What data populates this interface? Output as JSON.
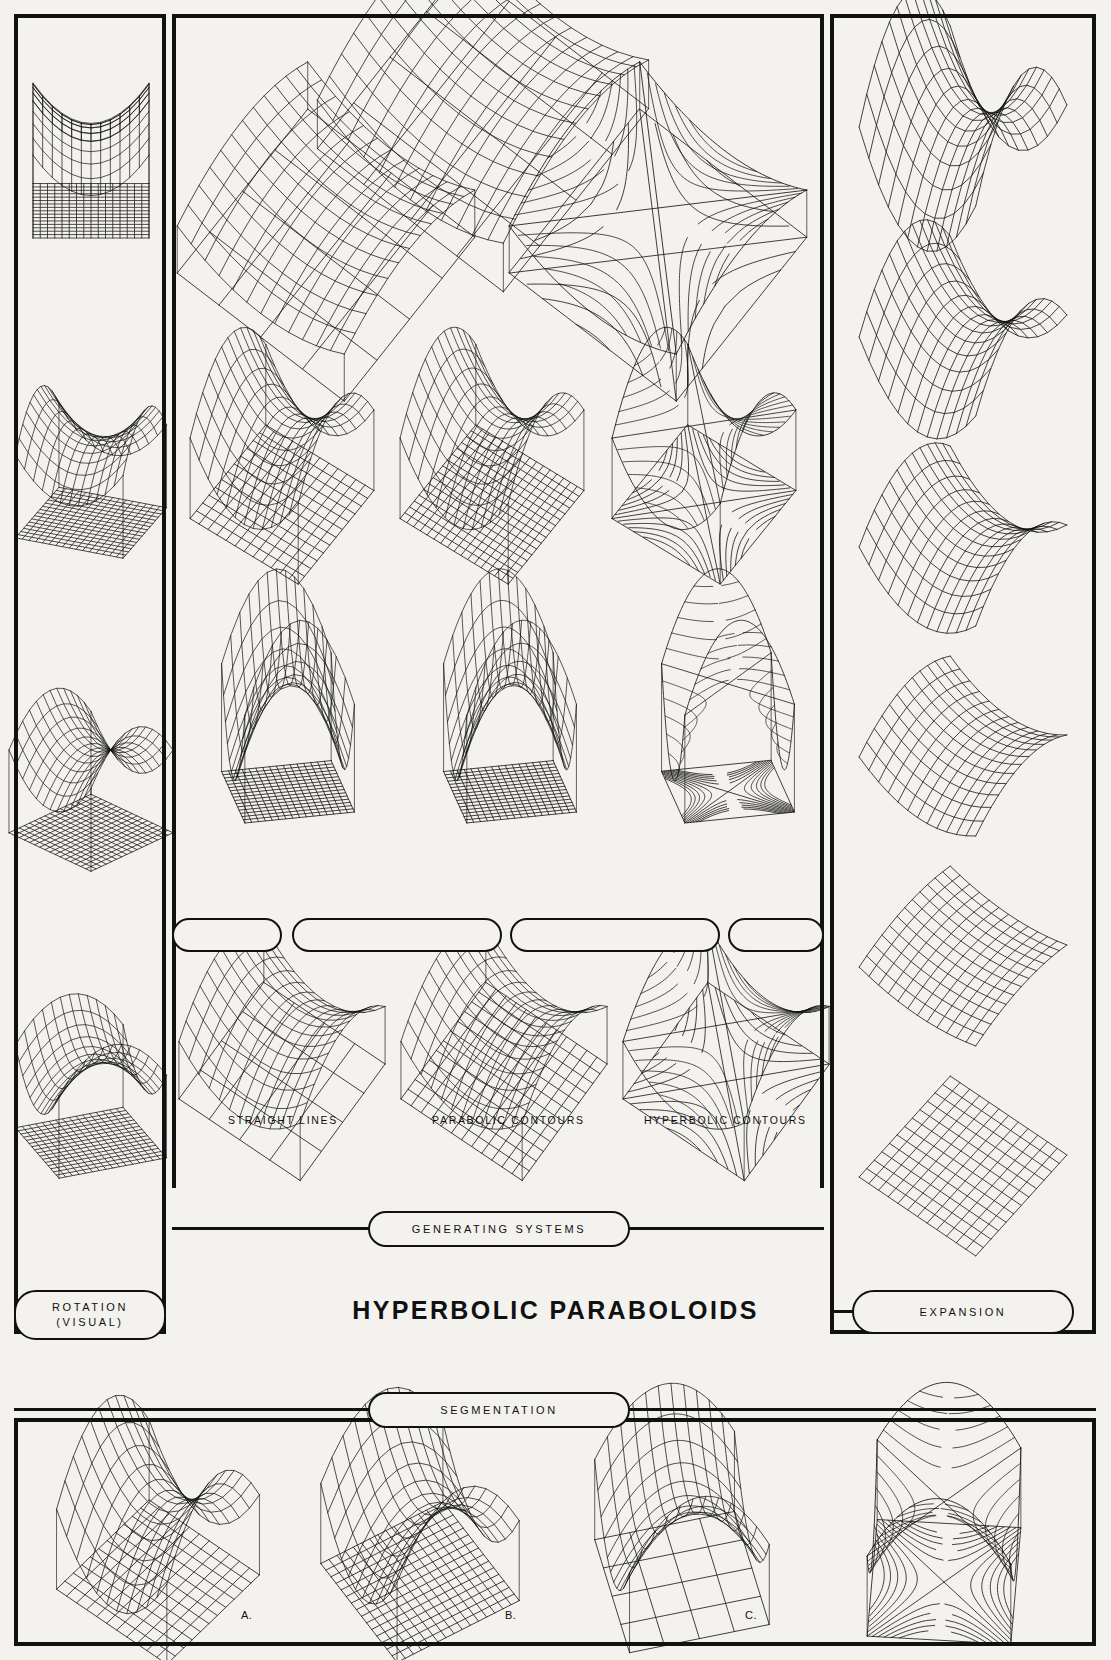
{
  "plate": {
    "title": "HYPERBOLIC PARABOLOIDS",
    "background": "#f4f2ee",
    "ink": "#111111"
  },
  "panels": {
    "rotation": {
      "label": "ROTATION",
      "sublabel": "(VISUAL)"
    },
    "expansion": {
      "label": "EXPANSION"
    },
    "generating": {
      "label": "GENERATING SYSTEMS"
    },
    "segmentation": {
      "label": "SEGMENTATION"
    }
  },
  "generating_captions": [
    "STRAIGHT LINES",
    "PARABOLIC CONTOURS",
    "HYPERBOLIC CONTOURS"
  ],
  "segmentation_letters": [
    "A.",
    "B.",
    "C.",
    "D."
  ],
  "chart_data": {
    "type": "surface-wireframe-plate",
    "title": "HYPERBOLIC PARABOLOIDS",
    "surface_equation": "z = a*x^2 - b*y^2",
    "domain": [
      -1,
      1
    ],
    "grid_divisions": 12,
    "projection": {
      "kind": "oblique-axonometric",
      "azimuth_deg": 35,
      "elevation_deg": 24
    },
    "columns": {
      "rotation": {
        "description": "Visual rotation of one saddle about the vertical axis, with projected base grid",
        "cells": [
          {
            "id": "rot-1",
            "yaw_deg": 0,
            "a": 1.0,
            "b": 1.0,
            "base": "grid",
            "base_style": "mesh",
            "drop_lines": true
          },
          {
            "id": "rot-2",
            "yaw_deg": 22,
            "a": 1.0,
            "b": 1.0,
            "base": "grid",
            "base_style": "mesh",
            "drop_lines": true
          },
          {
            "id": "rot-3",
            "yaw_deg": 45,
            "a": 1.0,
            "b": 1.0,
            "base": "grid",
            "base_style": "mesh",
            "drop_lines": true
          },
          {
            "id": "rot-4",
            "yaw_deg": 68,
            "a": 1.0,
            "b": 1.0,
            "base": "grid",
            "base_style": "mesh",
            "drop_lines": true
          }
        ]
      },
      "generating": {
        "description": "Three generating systems shown at four progressively steeper viewing tilts",
        "rows": [
          {
            "id": "gen-row-1",
            "tilt_deg": 8,
            "cells": [
              {
                "system": "straight-lines",
                "a": 0.55,
                "b": 0.55
              },
              {
                "system": "parabolic-contours",
                "a": 0.55,
                "b": 0.55
              },
              {
                "system": "hyperbolic-contours",
                "a": 0.55,
                "b": 0.55
              }
            ]
          },
          {
            "id": "gen-row-2",
            "tilt_deg": 26,
            "cells": [
              {
                "system": "straight-lines",
                "a": 1.0,
                "b": 1.0
              },
              {
                "system": "parabolic-contours",
                "a": 1.0,
                "b": 1.0
              },
              {
                "system": "hyperbolic-contours",
                "a": 1.0,
                "b": 1.0
              }
            ]
          },
          {
            "id": "gen-row-3",
            "tilt_deg": 52,
            "cells": [
              {
                "system": "straight-lines",
                "a": 1.7,
                "b": 1.7
              },
              {
                "system": "parabolic-contours",
                "a": 1.7,
                "b": 1.7
              },
              {
                "system": "hyperbolic-contours",
                "a": 1.7,
                "b": 1.7
              }
            ]
          },
          {
            "id": "gen-row-4",
            "tilt_deg": 14,
            "cells": [
              {
                "system": "straight-lines",
                "a": 0.7,
                "b": 0.7
              },
              {
                "system": "parabolic-contours",
                "a": 0.7,
                "b": 0.7
              },
              {
                "system": "hyperbolic-contours",
                "a": 0.7,
                "b": 0.7
              }
            ]
          }
        ]
      },
      "expansion": {
        "description": "Saddle curvature expanding/flattening from a sharp peak down to a flat plane",
        "cells": [
          {
            "id": "exp-1",
            "a": 1.45,
            "b": 1.45
          },
          {
            "id": "exp-2",
            "a": 1.0,
            "b": 1.0
          },
          {
            "id": "exp-3",
            "a": 0.65,
            "b": 0.65
          },
          {
            "id": "exp-4",
            "a": 0.38,
            "b": 0.38
          },
          {
            "id": "exp-5",
            "a": 0.16,
            "b": 0.16
          },
          {
            "id": "exp-6",
            "a": 0.0,
            "b": 0.0
          }
        ]
      },
      "segmentation": {
        "description": "Four segmentations of the saddle over a projected base plane",
        "cells": [
          {
            "id": "seg-a",
            "letter": "A.",
            "a": 1.15,
            "b": 1.15,
            "yaw_deg": 10,
            "system": "straight-lines",
            "base_style": "mesh"
          },
          {
            "id": "seg-b",
            "letter": "B.",
            "a": 1.15,
            "b": 1.15,
            "yaw_deg": 28,
            "system": "straight-lines",
            "base_style": "mesh-dense"
          },
          {
            "id": "seg-c",
            "letter": "C.",
            "a": 1.15,
            "b": 1.15,
            "yaw_deg": 46,
            "system": "parabolic-contours",
            "base_style": "plain"
          },
          {
            "id": "seg-d",
            "letter": "D.",
            "a": 1.15,
            "b": 1.15,
            "yaw_deg": 64,
            "system": "hyperbolic-contours",
            "base_style": "contour"
          }
        ]
      }
    }
  }
}
